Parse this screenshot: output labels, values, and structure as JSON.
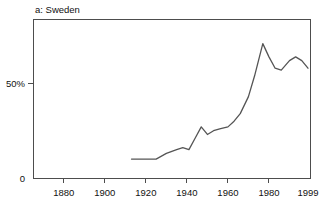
{
  "figure": {
    "panel_label": "a: Sweden",
    "background_color": "#ffffff",
    "line_color": "#555555",
    "axis_color": "#4d4d4d"
  },
  "chart_data": {
    "type": "line",
    "title": "a: Sweden",
    "xlabel": "",
    "ylabel": "",
    "xlim": [
      1865,
      2000
    ],
    "ylim": [
      0,
      84
    ],
    "grid": false,
    "legend": null,
    "xticks": [
      1880,
      1900,
      1920,
      1940,
      1960,
      1980,
      1999
    ],
    "xticklabels": [
      "1880",
      "1900",
      "1920",
      "1940",
      "1960",
      "1980",
      "1999"
    ],
    "yticks": [
      0,
      50
    ],
    "yticklabels": [
      "0",
      "50%"
    ],
    "series": [
      {
        "name": "Sweden",
        "x": [
          1913,
          1920,
          1925,
          1930,
          1935,
          1938,
          1941,
          1944,
          1947,
          1950,
          1953,
          1956,
          1960,
          1963,
          1966,
          1970,
          1973,
          1977,
          1980,
          1983,
          1986,
          1990,
          1993,
          1996,
          1999
        ],
        "values": [
          10,
          10,
          10,
          13,
          15,
          16,
          15,
          21,
          27,
          23,
          25,
          26,
          27,
          30,
          34,
          43,
          54,
          71,
          64,
          58,
          57,
          62,
          64,
          62,
          58
        ]
      }
    ]
  },
  "geometry": {
    "plot_left": 33,
    "plot_right": 310,
    "plot_top": 19,
    "plot_bottom": 178,
    "x_min_year": 1865,
    "x_max_year": 2000,
    "y_min_value": 0,
    "y_max_value": 84
  }
}
